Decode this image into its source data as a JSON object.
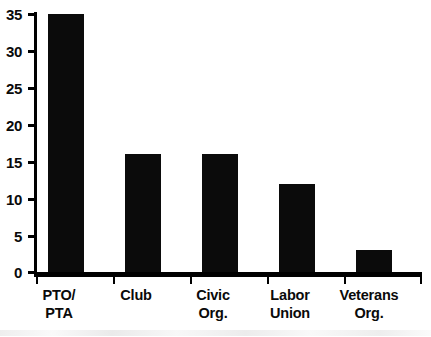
{
  "chart_data": {
    "type": "bar",
    "title": "",
    "subtitle": "",
    "xlabel": "",
    "ylabel": "",
    "categories": [
      "PTO/ PTA",
      "Club",
      "Civic Org.",
      "Labor Union",
      "Veterans Org."
    ],
    "category_lines": [
      [
        "PTO/",
        "PTA"
      ],
      [
        "Club",
        ""
      ],
      [
        "Civic",
        "Org."
      ],
      [
        "Labor",
        "Union"
      ],
      [
        "Veterans",
        "Org."
      ]
    ],
    "values": [
      35,
      16,
      16,
      12,
      3
    ],
    "ylim": [
      0,
      35
    ],
    "ytick_labels": [
      "35",
      "30",
      "25",
      "20",
      "15",
      "10",
      "5",
      "0"
    ],
    "ytick_values": [
      35,
      30,
      25,
      20,
      15,
      10,
      5,
      0
    ],
    "grid": false,
    "legend": false,
    "legend_position": "none",
    "bar_color": "#0b0b0b",
    "background_color": "#ffffff",
    "axis_color": "#000000"
  }
}
